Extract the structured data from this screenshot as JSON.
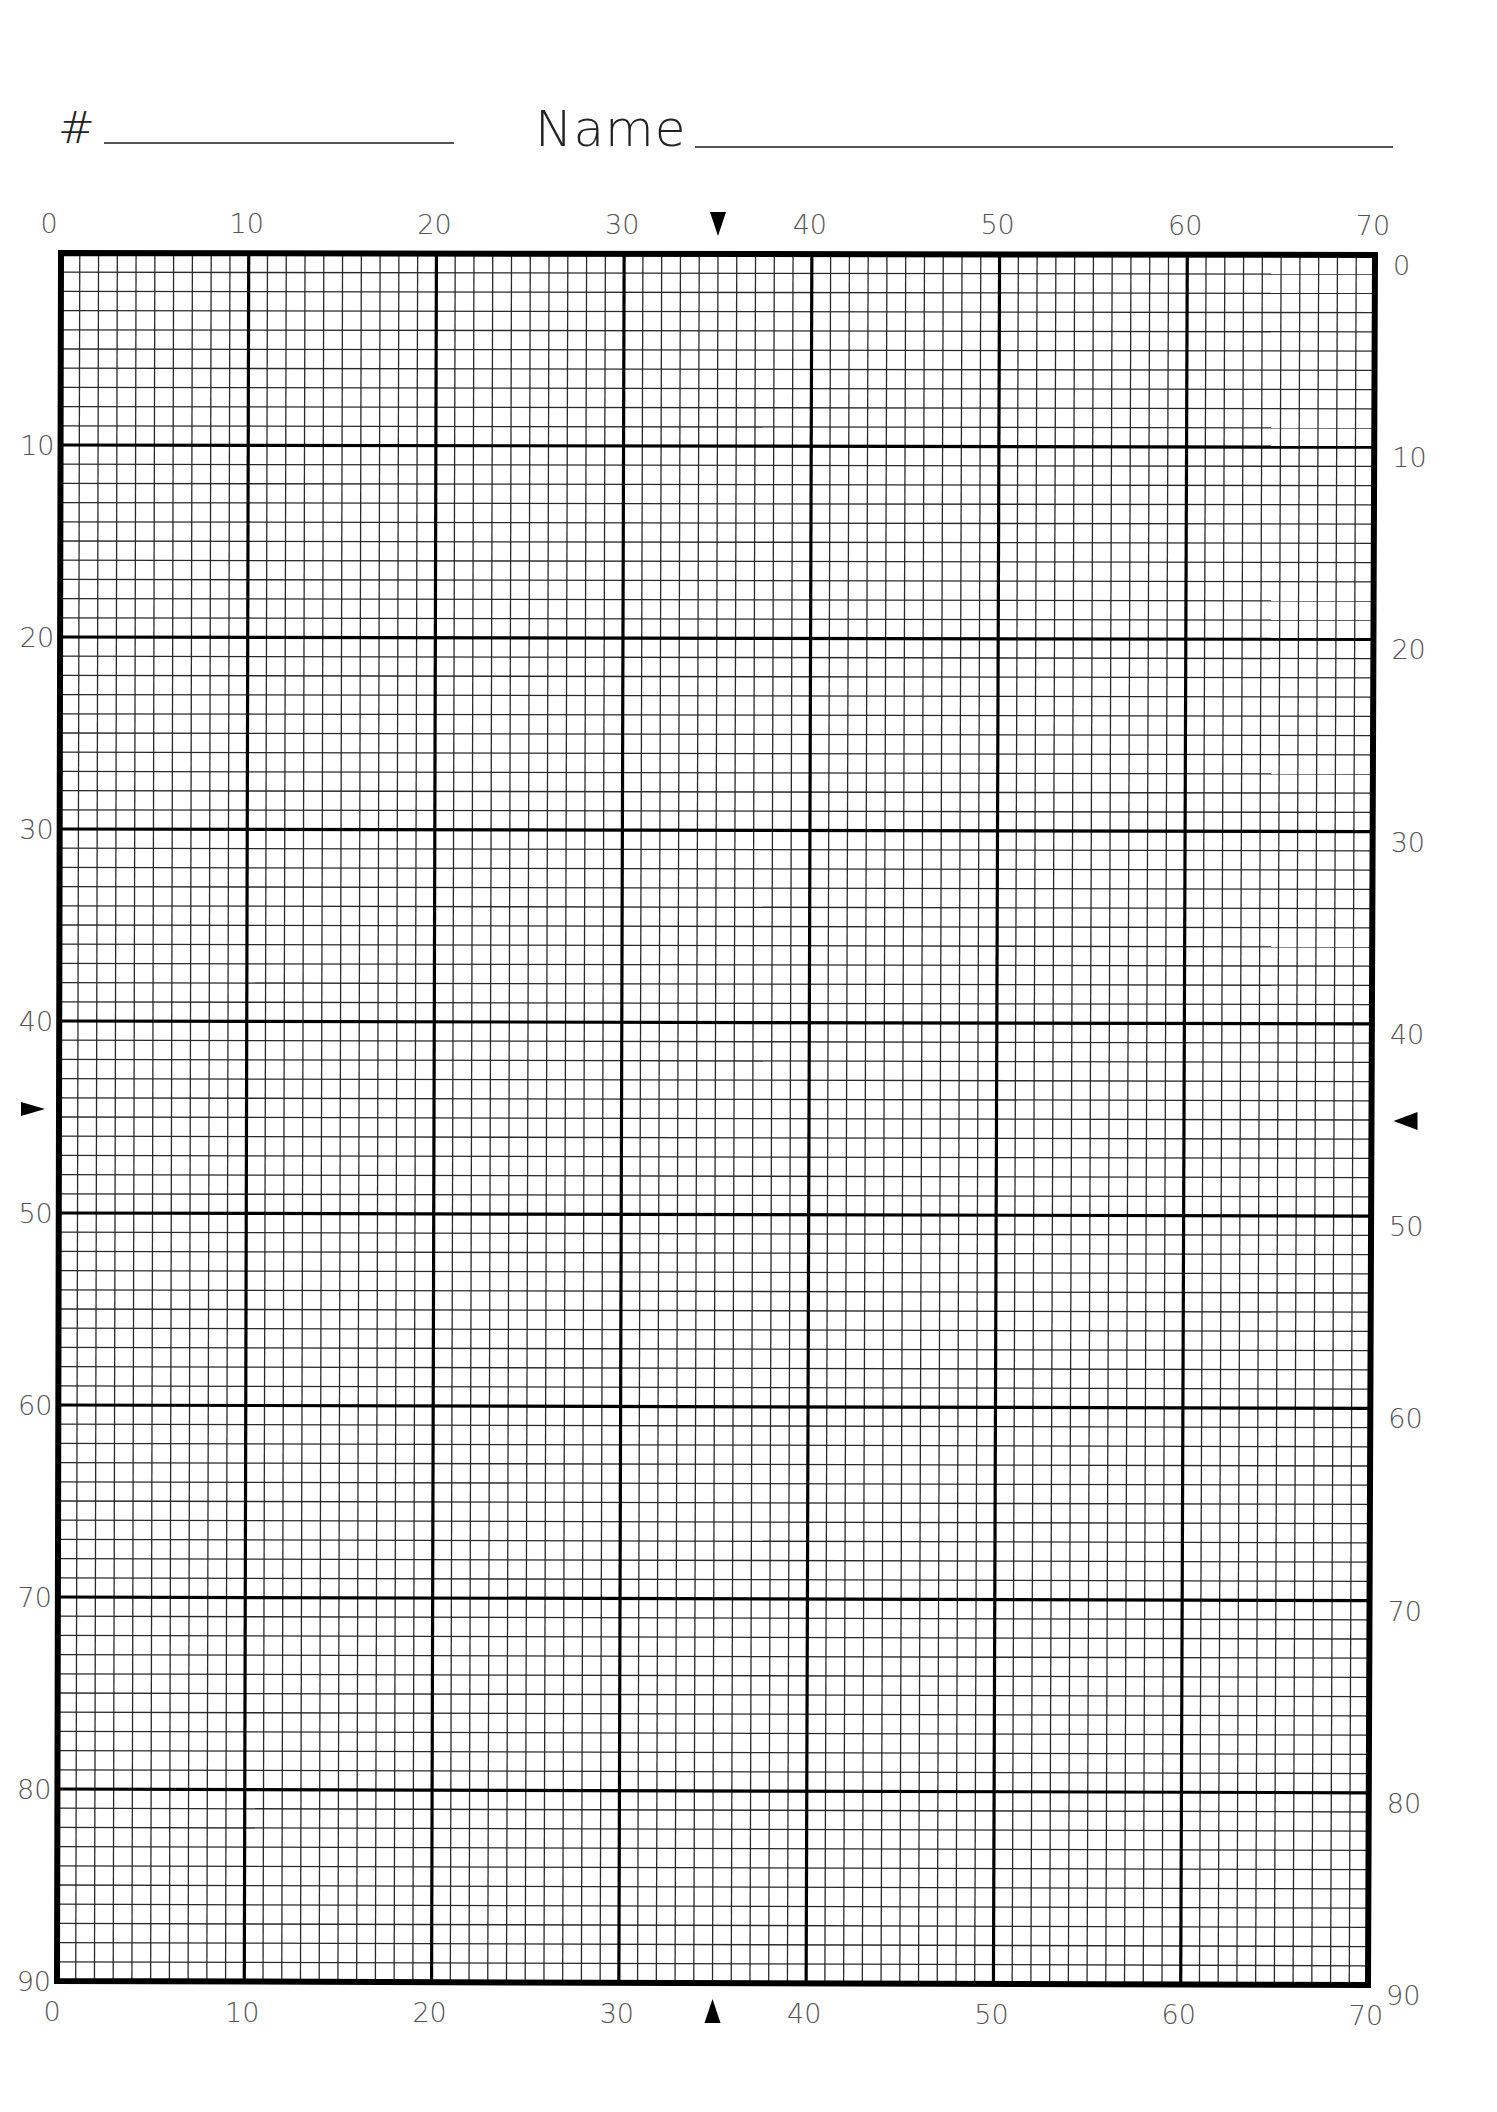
{
  "form": {
    "number_label": "#",
    "number_value": "",
    "name_label": "Name",
    "name_value": ""
  },
  "grid": {
    "columns": 70,
    "rows": 90,
    "major_every": 10,
    "corners": {
      "top_left": [
        61,
        253
      ],
      "top_right": [
        1375,
        255
      ],
      "bottom_left": [
        57,
        1981
      ],
      "bottom_right": [
        1368,
        1985
      ]
    },
    "colors": {
      "minor_line": "#2a2a2a",
      "major_line": "#000000",
      "border": "#000000",
      "label": "#555555",
      "marker": "#000000"
    },
    "minor_width": 1.3,
    "major_width": 3.2,
    "border_width": 6
  },
  "axes": {
    "top_labels": [
      "0",
      "10",
      "20",
      "30",
      "40",
      "50",
      "60",
      "70"
    ],
    "bottom_labels": [
      "0",
      "10",
      "20",
      "30",
      "40",
      "50",
      "60",
      "70"
    ],
    "left_labels": [
      "10",
      "20",
      "30",
      "40",
      "50",
      "60",
      "70",
      "80",
      "90"
    ],
    "right_labels": [
      "0",
      "10",
      "20",
      "30",
      "40",
      "50",
      "60",
      "70",
      "80",
      "90"
    ]
  },
  "markers": {
    "center_column": 35,
    "center_row": 45,
    "top": "triangle-down",
    "bottom": "triangle-up",
    "left": "triangle-right",
    "right": "triangle-left"
  }
}
